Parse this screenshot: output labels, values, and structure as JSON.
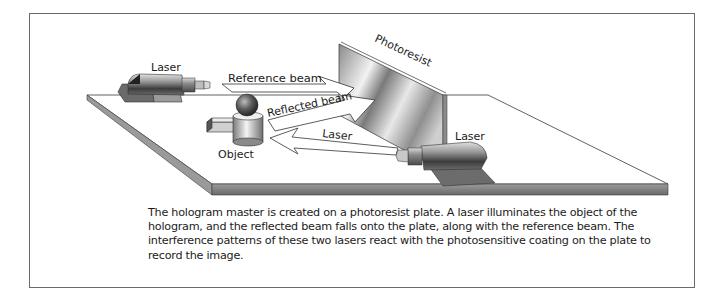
{
  "figure": {
    "labels": {
      "laser_left": "Laser",
      "reference_beam": "Reference beam",
      "reflected_beam": "Reflected beam",
      "laser_beam": "Laser",
      "photoresist": "Photoresist",
      "laser_right": "Laser",
      "object": "Object"
    },
    "colors": {
      "frame_border": "#6a6a6a",
      "table_edge": "#8a8a8a",
      "metal_dark": "#555555",
      "metal_light": "#d8d8d8"
    }
  },
  "caption": {
    "text": "The hologram master is created on a photoresist plate. A laser illuminates the object of the hologram, and the reflected beam falls onto the plate, along with the reference beam. The interference patterns of these two lasers react with the photosensitive coating on the plate to record the image."
  }
}
